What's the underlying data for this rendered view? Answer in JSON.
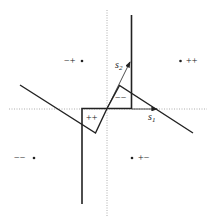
{
  "diagram": {
    "quadrant_labels": {
      "upper_left": "−+",
      "upper_right": "++",
      "lower_left": "−−",
      "lower_right": "+−"
    },
    "region_labels": {
      "inner_left": "++",
      "inner_right": "−−"
    },
    "vectors": {
      "s1": {
        "base": "s",
        "sub": "1"
      },
      "s2": {
        "base": "s",
        "sub": "2"
      }
    },
    "colors": {
      "line": "#222222",
      "axis": "#999999",
      "background": "#ffffff"
    }
  }
}
